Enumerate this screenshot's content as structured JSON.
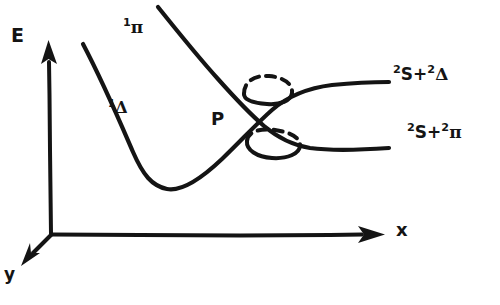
{
  "figure": {
    "kind": "hand-drawn-sketch",
    "ink_color": "#141414",
    "background_color": "#ffffff"
  },
  "axes": {
    "energy": {
      "label": "E",
      "direction": "up"
    },
    "x": {
      "label": "x",
      "direction": "right"
    },
    "y": {
      "label": "y",
      "direction": "down-left"
    }
  },
  "curves": {
    "pi_state": {
      "label_parts": {
        "superscript": "1",
        "symbol": "π"
      },
      "label_text": "1π"
    },
    "delta_state": {
      "label_parts": {
        "superscript": "1",
        "symbol": "Δ"
      },
      "label_text": "1Δ"
    }
  },
  "annotations": {
    "crossing_point": {
      "label": "P"
    },
    "circled_regions": [
      {
        "name": "upper-avoided-crossing-ring"
      },
      {
        "name": "lower-avoided-crossing-ring"
      }
    ]
  },
  "asymptotes": {
    "upper": {
      "sup1": "2",
      "term1": "S",
      "operator": "+",
      "sup2": "2",
      "term2": "Δ",
      "text": "2S+2Δ"
    },
    "lower": {
      "sup1": "2",
      "term1": "S",
      "operator": "+",
      "sup2": "2",
      "term2": "π",
      "text": "2S+2π"
    }
  }
}
